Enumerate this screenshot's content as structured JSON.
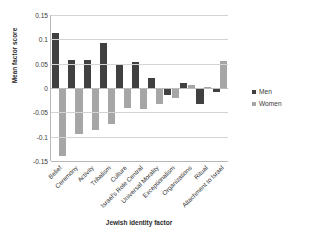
{
  "chart_data": {
    "type": "bar",
    "title": "",
    "xlabel": "Jewish identity factor",
    "ylabel": "Mean factor score",
    "ylim": [
      -0.15,
      0.15
    ],
    "yticks": [
      0.15,
      0.1,
      0.05,
      0,
      -0.05,
      -0.1,
      -0.15
    ],
    "ytick_labels": [
      "0.15",
      "0.1",
      "0.05",
      "0",
      "-0.05",
      "-0.1",
      "-0.15"
    ],
    "grid": true,
    "legend_position": "right",
    "categories": [
      "Belief",
      "Ceremony",
      "Activity",
      "Tribalism",
      "Culture",
      "Israel's Role Central",
      "Universal Morality",
      "Exceptionalism",
      "Organizations",
      "Ritual",
      "Attachment to Israel"
    ],
    "series": [
      {
        "name": "Men",
        "color": "#404040",
        "values": [
          0.112,
          0.057,
          0.058,
          0.092,
          0.05,
          0.053,
          0.02,
          -0.014,
          0.01,
          -0.033,
          -0.009
        ]
      },
      {
        "name": "Women",
        "color": "#a6a6a6",
        "values": [
          -0.139,
          -0.094,
          -0.086,
          -0.074,
          -0.041,
          -0.043,
          -0.033,
          -0.021,
          0.006,
          0.002,
          0.055
        ]
      }
    ]
  },
  "legend": {
    "items": [
      {
        "label": "Men",
        "color": "#404040"
      },
      {
        "label": "Women",
        "color": "#a6a6a6"
      }
    ]
  }
}
